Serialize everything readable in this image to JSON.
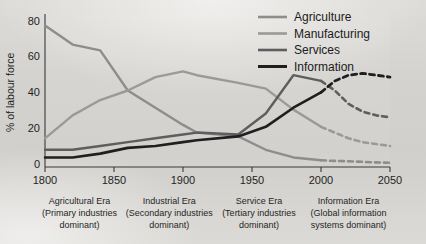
{
  "chart_data": {
    "type": "line",
    "title": "",
    "xlabel": "",
    "ylabel": "% of labour force",
    "xlim": [
      1800,
      2050
    ],
    "ylim": [
      0,
      80
    ],
    "grid": false,
    "legend_position": "top-right",
    "xticks": [
      "1800",
      "1850",
      "1900",
      "1950",
      "2000",
      "2050"
    ],
    "yticks": [
      "0",
      "20",
      "40",
      "60",
      "80"
    ],
    "x": [
      1800,
      1820,
      1840,
      1860,
      1880,
      1900,
      1910,
      1940,
      1960,
      1980,
      2000,
      2010,
      2020,
      2030,
      2040,
      2050
    ],
    "series": [
      {
        "name": "Agriculture",
        "color": "#8d8d8d",
        "values": [
          74,
          64,
          61,
          40,
          31,
          22,
          18,
          16,
          9,
          5,
          3.5,
          3.2,
          3,
          2.7,
          2.4,
          2.2
        ],
        "solid_until": 2000,
        "dashed_from": 2000
      },
      {
        "name": "Manufacturing",
        "color": "#9a9a9a",
        "values": [
          15,
          27,
          35,
          40,
          47,
          50,
          48,
          44,
          41,
          30,
          21,
          18,
          15,
          13,
          12,
          11
        ],
        "solid_until": 2000,
        "dashed_from": 2000
      },
      {
        "name": "Services",
        "color": "#5e5e5e",
        "values": [
          9,
          9,
          11,
          13,
          15,
          17,
          18,
          17,
          28,
          48,
          45,
          40,
          33,
          29,
          27,
          26
        ],
        "solid_until": 2000,
        "dashed_from": 2000
      },
      {
        "name": "Information",
        "color": "#1f1f1f",
        "values": [
          5,
          5,
          7,
          10,
          11,
          13,
          14,
          16,
          21,
          31,
          39,
          45,
          48,
          49,
          48,
          47
        ],
        "solid_until": 2000,
        "dashed_from": 2000
      }
    ],
    "eras": [
      {
        "name": "Agricultural Era",
        "line2": "(Primary industries",
        "line3": "dominant)",
        "x_center": 1825
      },
      {
        "name": "Industrial Era",
        "line2": "(Secondary industries",
        "line3": "dominant)",
        "x_center": 1890
      },
      {
        "name": "Service Era",
        "line2": "(Tertiary industries",
        "line3": "dominant)",
        "x_center": 1955
      },
      {
        "name": "Information Era",
        "line2": "(Global information",
        "line3": "systems dominant)",
        "x_center": 2020
      }
    ]
  },
  "legend": {
    "items": [
      {
        "label": "Agriculture"
      },
      {
        "label": "Manufacturing"
      },
      {
        "label": "Services"
      },
      {
        "label": "Information"
      }
    ]
  }
}
